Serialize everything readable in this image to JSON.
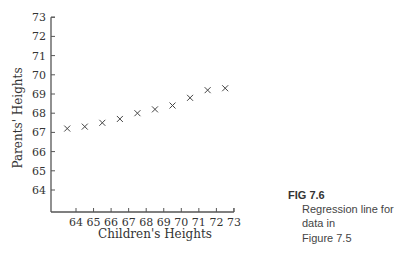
{
  "chart_data": {
    "type": "scatter",
    "title": "",
    "xlabel": "Children's Heights",
    "ylabel": "Parents' Heights",
    "xlim": [
      63,
      73
    ],
    "ylim": [
      63,
      73
    ],
    "x_ticks": [
      64,
      65,
      66,
      67,
      68,
      69,
      70,
      71,
      72,
      73
    ],
    "y_ticks": [
      64,
      65,
      66,
      67,
      68,
      69,
      70,
      71,
      72,
      73
    ],
    "grid": false,
    "marker": "x",
    "series": [
      {
        "name": "Regression line points",
        "x": [
          63.5,
          64.5,
          65.5,
          66.5,
          67.5,
          68.5,
          69.5,
          70.5,
          71.5,
          72.5
        ],
        "y": [
          67.2,
          67.3,
          67.5,
          67.7,
          68.0,
          68.2,
          68.4,
          68.8,
          69.2,
          69.3
        ]
      }
    ]
  },
  "caption": {
    "figure_label": "FIG 7.6",
    "text_line1": "Regression line for data in",
    "text_line2": "Figure 7.5"
  },
  "colors": {
    "axis": "#555555",
    "marker": "#444444",
    "text": "#333333"
  }
}
